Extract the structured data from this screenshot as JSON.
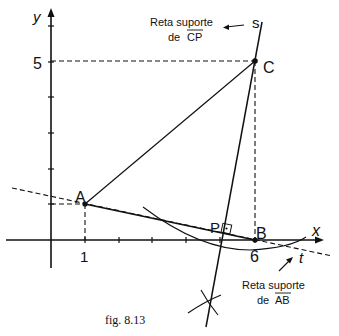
{
  "figure": {
    "caption": "fig. 8.13",
    "axes": {
      "x_label": "x",
      "y_label": "y",
      "x_ticks": [
        "1",
        "6"
      ],
      "y_ticks": [
        "5"
      ]
    },
    "points": {
      "A": {
        "label": "A",
        "coords": [
          1,
          1
        ]
      },
      "B": {
        "label": "B",
        "coords": [
          6,
          0
        ]
      },
      "C": {
        "label": "C",
        "coords": [
          6,
          5
        ]
      },
      "P": {
        "label": "P"
      }
    },
    "lines": {
      "s": {
        "label": "s",
        "note_line1": "Reta suporte",
        "note_line2_prefix": "de ",
        "note_segment": "CP"
      },
      "t": {
        "label": "t",
        "note_line1": "Reta suporte",
        "note_line2_prefix": "de ",
        "note_segment": "AB"
      }
    }
  }
}
